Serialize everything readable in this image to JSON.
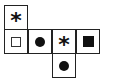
{
  "diagram": {
    "type": "cube-net",
    "cells": [
      {
        "id": "top",
        "row": 0,
        "col": 0,
        "symbol": "star"
      },
      {
        "id": "r1c0",
        "row": 1,
        "col": 0,
        "symbol": "open-square"
      },
      {
        "id": "r1c1",
        "row": 1,
        "col": 1,
        "symbol": "filled-circle"
      },
      {
        "id": "r1c2",
        "row": 1,
        "col": 2,
        "symbol": "star"
      },
      {
        "id": "r1c3",
        "row": 1,
        "col": 3,
        "symbol": "filled-square"
      },
      {
        "id": "bottom",
        "row": 2,
        "col": 2,
        "symbol": "filled-circle"
      }
    ],
    "star_glyph": "*"
  }
}
